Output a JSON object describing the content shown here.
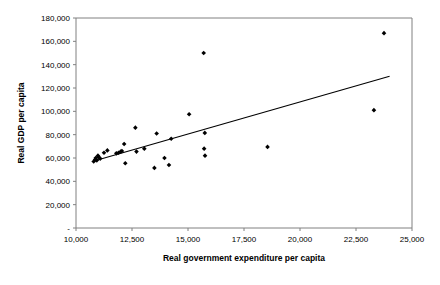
{
  "chart_data": {
    "type": "scatter",
    "title": "",
    "xlabel": "Real government expenditure per capita",
    "ylabel": "Real GDP per capita",
    "xlim": [
      10000,
      25000
    ],
    "ylim": [
      0,
      180000
    ],
    "grid": false,
    "legend": null,
    "xticks": [
      10000,
      12500,
      15000,
      17500,
      20000,
      22500,
      25000
    ],
    "xtick_labels": [
      "10,000",
      "12,500",
      "15,000",
      "17,500",
      "20,000",
      "22,500",
      "25,000"
    ],
    "yticks": [
      0,
      20000,
      40000,
      60000,
      80000,
      100000,
      120000,
      140000,
      160000,
      180000
    ],
    "ytick_labels": [
      "-",
      "20,000",
      "40,000",
      "60,000",
      "80,000",
      "100,000",
      "120,000",
      "140,000",
      "160,000",
      "180,000"
    ],
    "marker": "diamond",
    "marker_color": "#000000",
    "series": [
      {
        "name": "observations",
        "points": [
          [
            10790,
            57000
          ],
          [
            10850,
            58500
          ],
          [
            10880,
            60000
          ],
          [
            10930,
            58000
          ],
          [
            10980,
            62000
          ],
          [
            11000,
            61000
          ],
          [
            11080,
            59500
          ],
          [
            11250,
            64500
          ],
          [
            11400,
            66500
          ],
          [
            11800,
            64000
          ],
          [
            11900,
            64500
          ],
          [
            12000,
            65500
          ],
          [
            12050,
            66000
          ],
          [
            12150,
            72000
          ],
          [
            12200,
            55500
          ],
          [
            12650,
            86000
          ],
          [
            12700,
            65500
          ],
          [
            13050,
            68000
          ],
          [
            13500,
            51500
          ],
          [
            13600,
            81000
          ],
          [
            13950,
            60000
          ],
          [
            14150,
            54000
          ],
          [
            14250,
            76500
          ],
          [
            15050,
            97500
          ],
          [
            15700,
            150000
          ],
          [
            15750,
            81500
          ],
          [
            15720,
            68000
          ],
          [
            15760,
            62000
          ],
          [
            18550,
            69500
          ],
          [
            23300,
            101000
          ],
          [
            23750,
            167000
          ]
        ]
      }
    ],
    "trendline": {
      "type": "linear",
      "x_start": 10800,
      "y_start": 57500,
      "x_end": 24000,
      "y_end": 130000,
      "color": "#000000"
    }
  },
  "axes": {
    "x_title": "Real government expenditure per capita",
    "y_title": "Real GDP per capita"
  }
}
